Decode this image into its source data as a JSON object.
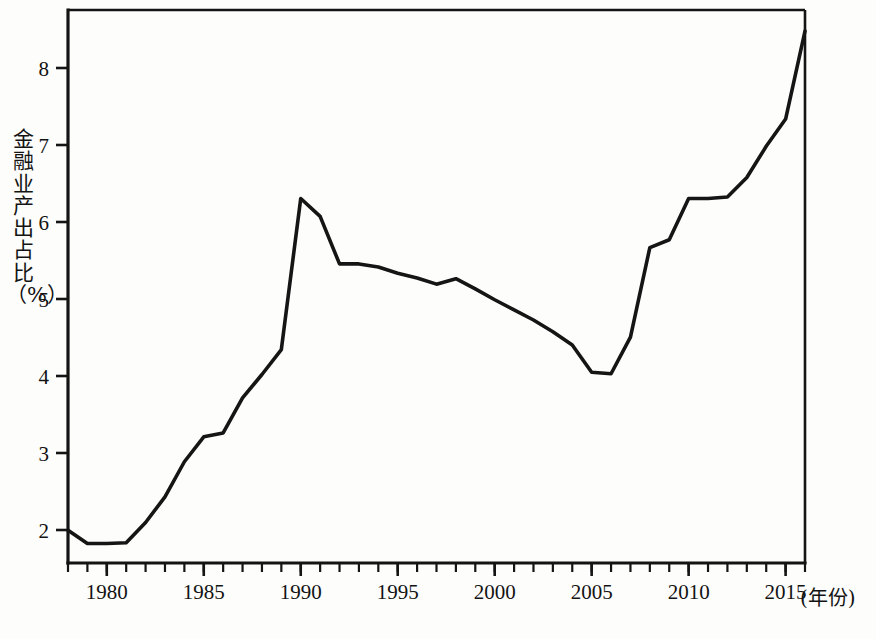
{
  "figure": {
    "background_color": "#fdfdfc",
    "line_color": "#151515",
    "axis_color": "#141414"
  },
  "axes": {
    "y_axis_label": "金融业产出占比（%）",
    "x_axis_unit_label": "(年份)",
    "y_ticks": [
      "2",
      "3",
      "4",
      "5",
      "6",
      "7",
      "8"
    ],
    "x_ticks": [
      "1980",
      "1985",
      "1990",
      "1995",
      "2000",
      "2005",
      "2010",
      "2015"
    ]
  },
  "chart_data": {
    "type": "line",
    "title": "",
    "subtitle": "",
    "xlabel": "(年份)",
    "ylabel": "金融业产出占比（%）",
    "xlim": [
      1978,
      2016
    ],
    "ylim": [
      1.6,
      8.7
    ],
    "grid": false,
    "legend": false,
    "legend_position": "none",
    "x_tick_labels": [
      "1980",
      "1985",
      "1990",
      "1995",
      "2000",
      "2005",
      "2010",
      "2015"
    ],
    "x_tick_values": [
      1980,
      1985,
      1990,
      1995,
      2000,
      2005,
      2010,
      2015
    ],
    "x_minor_tick_interval": 1,
    "y_tick_labels": [
      "2",
      "3",
      "4",
      "5",
      "6",
      "7",
      "8"
    ],
    "y_tick_values": [
      2,
      3,
      4,
      5,
      6,
      7,
      8
    ],
    "series": [
      {
        "name": "金融业产出占比",
        "color": "#151515",
        "x": [
          1978,
          1979,
          1980,
          1981,
          1982,
          1983,
          1984,
          1985,
          1986,
          1987,
          1988,
          1989,
          1990,
          1991,
          1992,
          1993,
          1994,
          1995,
          1996,
          1997,
          1998,
          1999,
          2000,
          2001,
          2002,
          2003,
          2004,
          2005,
          2006,
          2007,
          2008,
          2009,
          2010,
          2011,
          2012,
          2013,
          2014,
          2015,
          2016
        ],
        "values": [
          2.02,
          1.85,
          1.85,
          1.86,
          2.12,
          2.45,
          2.9,
          3.22,
          3.27,
          3.72,
          4.02,
          4.34,
          6.28,
          6.05,
          5.44,
          5.44,
          5.4,
          5.32,
          5.26,
          5.18,
          5.25,
          5.12,
          4.98,
          4.85,
          4.72,
          4.57,
          4.4,
          4.05,
          4.03,
          4.5,
          5.65,
          5.75,
          6.28,
          6.28,
          6.3,
          6.55,
          6.95,
          7.3,
          8.43
        ]
      }
    ],
    "annotations": []
  }
}
